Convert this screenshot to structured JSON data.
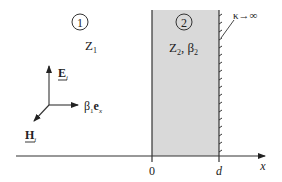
{
  "diagram": {
    "region1": {
      "number": "1",
      "impedance_main": "Z",
      "impedance_sub": "1"
    },
    "region2": {
      "number": "2",
      "label_z": "Z",
      "label_z_sub": "2",
      "sep": ", ",
      "label_beta": "β",
      "label_beta_sub": "2",
      "fill_color": "#d9d9d9"
    },
    "wall": {
      "label": "κ→∞"
    },
    "vectors": {
      "e_main": "E",
      "e_sub": "i",
      "h_main": "H",
      "h_sub": "i",
      "k_beta": "β",
      "k_beta_sub": "1",
      "k_e": "e",
      "k_e_sub": "x"
    },
    "axis": {
      "origin_label": "0",
      "d_label": "d",
      "x_label": "x"
    }
  }
}
